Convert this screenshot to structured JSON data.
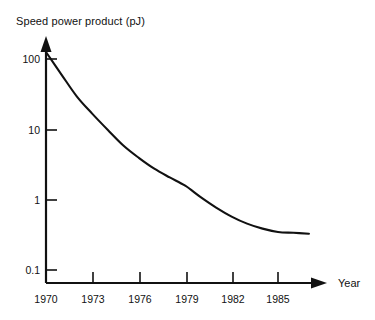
{
  "chart_data": {
    "type": "line",
    "title": "Speed power product (pJ)",
    "xlabel": "Year",
    "ylabel": "Speed power product (pJ)",
    "yscale": "log",
    "xlim": [
      1970,
      1987
    ],
    "ylim": [
      0.1,
      200
    ],
    "grid": false,
    "legend": "none",
    "x_tick_labels": [
      "1970",
      "1973",
      "1976",
      "1979",
      "1982",
      "1985"
    ],
    "x_tick_values": [
      1970,
      1973,
      1976,
      1979,
      1982,
      1985
    ],
    "y_tick_labels": [
      "100",
      "10",
      "1",
      "0.1"
    ],
    "y_tick_values": [
      100,
      10,
      1,
      0.1
    ],
    "series": [
      {
        "name": "Speed power product",
        "x": [
          1970,
          1971,
          1972,
          1973,
          1974,
          1975,
          1976,
          1977,
          1978,
          1979,
          1980,
          1981,
          1982,
          1983,
          1984,
          1985,
          1986,
          1987
        ],
        "values": [
          130,
          62,
          30,
          17,
          10,
          6.0,
          4.0,
          2.8,
          2.1,
          1.6,
          1.1,
          0.78,
          0.58,
          0.46,
          0.39,
          0.35,
          0.34,
          0.33
        ]
      }
    ]
  },
  "axes": {
    "y_axis_name": "Speed power product (pJ)",
    "x_axis_name": "Year",
    "y_ticks": [
      {
        "label": "100"
      },
      {
        "label": "10"
      },
      {
        "label": "1"
      },
      {
        "label": "0.1"
      }
    ],
    "x_ticks": [
      {
        "label": "1970"
      },
      {
        "label": "1973"
      },
      {
        "label": "1976"
      },
      {
        "label": "1979"
      },
      {
        "label": "1982"
      },
      {
        "label": "1985"
      }
    ]
  },
  "colors": {
    "background": "#ffffff",
    "axis": "#111111",
    "curve": "#111111",
    "text": "#111111"
  }
}
